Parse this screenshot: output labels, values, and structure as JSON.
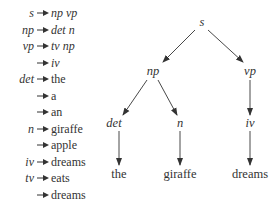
{
  "grammar": {
    "rules": [
      {
        "lhs": "s",
        "rhs": "np vp",
        "rhs_italic": true
      },
      {
        "lhs": "np",
        "rhs": "det n",
        "rhs_italic": true
      },
      {
        "lhs": "vp",
        "rhs": "tv np",
        "rhs_italic": true
      },
      {
        "lhs": "",
        "rhs": "iv",
        "rhs_italic": true
      },
      {
        "lhs": "det",
        "rhs": "the",
        "rhs_italic": false
      },
      {
        "lhs": "",
        "rhs": "a",
        "rhs_italic": false
      },
      {
        "lhs": "",
        "rhs": "an",
        "rhs_italic": false
      },
      {
        "lhs": "n",
        "rhs": "giraffe",
        "rhs_italic": false
      },
      {
        "lhs": "",
        "rhs": "apple",
        "rhs_italic": false
      },
      {
        "lhs": "iv",
        "rhs": "dreams",
        "rhs_italic": false
      },
      {
        "lhs": "tv",
        "rhs": "eats",
        "rhs_italic": false
      },
      {
        "lhs": "",
        "rhs": "dreams",
        "rhs_italic": false
      }
    ]
  },
  "tree": {
    "nodes": {
      "s": {
        "label": "s",
        "x": 202,
        "y": 22
      },
      "np": {
        "label": "np",
        "x": 153,
        "y": 71
      },
      "vp": {
        "label": "vp",
        "x": 250,
        "y": 71
      },
      "det": {
        "label": "det",
        "x": 114,
        "y": 123
      },
      "n": {
        "label": "n",
        "x": 180,
        "y": 123
      },
      "iv": {
        "label": "iv",
        "x": 250,
        "y": 123
      },
      "the": {
        "label": "the",
        "x": 119,
        "y": 174
      },
      "giraffe": {
        "label": "giraffe",
        "x": 180,
        "y": 174
      },
      "dreams": {
        "label": "dreams",
        "x": 250,
        "y": 174
      }
    },
    "edges": [
      [
        "s",
        "np"
      ],
      [
        "s",
        "vp"
      ],
      [
        "np",
        "det"
      ],
      [
        "np",
        "n"
      ],
      [
        "vp",
        "iv"
      ],
      [
        "det",
        "the"
      ],
      [
        "n",
        "giraffe"
      ],
      [
        "iv",
        "dreams"
      ]
    ]
  },
  "colors": {
    "ink": "#333333",
    "background": "#ffffff"
  }
}
